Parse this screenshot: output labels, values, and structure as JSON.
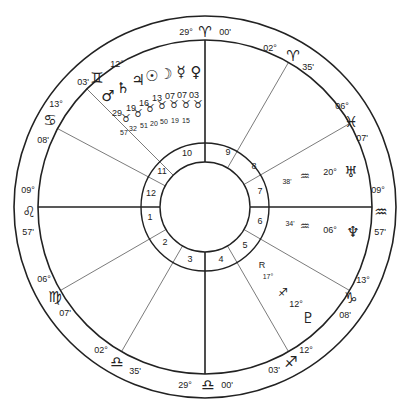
{
  "chart": {
    "center": [
      205,
      207
    ],
    "radii": {
      "outer": 191,
      "zodiac_inner": 167,
      "house_outer": 64,
      "house_inner": 45
    },
    "line_color": "#222222",
    "background": "#ffffff"
  },
  "cusps": [
    {
      "house": 1,
      "angle": 180,
      "heavy": true
    },
    {
      "house": 2,
      "angle": 210,
      "heavy": false
    },
    {
      "house": 3,
      "angle": 240,
      "heavy": false
    },
    {
      "house": 4,
      "angle": 270,
      "heavy": true
    },
    {
      "house": 5,
      "angle": 300,
      "heavy": false
    },
    {
      "house": 6,
      "angle": 330,
      "heavy": false
    },
    {
      "house": 7,
      "angle": 0,
      "heavy": true
    },
    {
      "house": 8,
      "angle": 30,
      "heavy": false
    },
    {
      "house": 9,
      "angle": 60,
      "heavy": false
    },
    {
      "house": 10,
      "angle": 90,
      "heavy": true
    },
    {
      "house": 11,
      "angle": 135,
      "heavy": false
    },
    {
      "house": 12,
      "angle": 152,
      "heavy": false
    }
  ],
  "house_numbers": [
    {
      "n": "1",
      "x": 150,
      "y": 220
    },
    {
      "n": "2",
      "x": 165,
      "y": 245
    },
    {
      "n": "3",
      "x": 190,
      "y": 262
    },
    {
      "n": "4",
      "x": 221,
      "y": 262
    },
    {
      "n": "5",
      "x": 245,
      "y": 248
    },
    {
      "n": "6",
      "x": 260,
      "y": 224
    },
    {
      "n": "7",
      "x": 260,
      "y": 194
    },
    {
      "n": "8",
      "x": 254,
      "y": 169
    },
    {
      "n": "9",
      "x": 228,
      "y": 155
    },
    {
      "n": "10",
      "x": 187,
      "y": 156
    },
    {
      "n": "11",
      "x": 162,
      "y": 174
    },
    {
      "n": "12",
      "x": 151,
      "y": 196
    }
  ],
  "cusp_signs": [
    {
      "cusp": "MC",
      "glyph": "♈",
      "deg": "29°",
      "min": "00'",
      "glyph_pos": [
        205,
        32
      ],
      "deg_pos": [
        186,
        32
      ],
      "min_pos": [
        225,
        32
      ]
    },
    {
      "cusp": "9",
      "glyph": "♈",
      "deg": "02°",
      "min": "35'",
      "glyph_pos": [
        293,
        56
      ],
      "deg_pos": [
        270,
        48
      ],
      "min_pos": [
        308,
        67
      ]
    },
    {
      "cusp": "8",
      "glyph": "♓",
      "deg": "06°",
      "min": "07'",
      "glyph_pos": [
        351,
        122
      ],
      "deg_pos": [
        342,
        106
      ],
      "min_pos": [
        362,
        138
      ]
    },
    {
      "cusp": "DSC",
      "glyph": "♒",
      "deg": "09°",
      "min": "57'",
      "glyph_pos": [
        381,
        212
      ],
      "deg_pos": [
        378,
        190
      ],
      "min_pos": [
        380,
        232
      ]
    },
    {
      "cusp": "6",
      "glyph": "♑",
      "deg": "13°",
      "min": "08'",
      "glyph_pos": [
        351,
        298
      ],
      "deg_pos": [
        363,
        280
      ],
      "min_pos": [
        345,
        315
      ]
    },
    {
      "cusp": "5",
      "glyph": "♐",
      "deg": "12°",
      "min": "03'",
      "glyph_pos": [
        291,
        362
      ],
      "deg_pos": [
        306,
        350
      ],
      "min_pos": [
        274,
        370
      ]
    },
    {
      "cusp": "IC",
      "glyph": "♎",
      "deg": "29°",
      "min": "00'",
      "glyph_pos": [
        208,
        385
      ],
      "deg_pos": [
        185,
        385
      ],
      "min_pos": [
        227,
        385
      ]
    },
    {
      "cusp": "3",
      "glyph": "♎",
      "deg": "02°",
      "min": "35'",
      "glyph_pos": [
        117,
        362
      ],
      "deg_pos": [
        101,
        350
      ],
      "min_pos": [
        135,
        371
      ]
    },
    {
      "cusp": "2",
      "glyph": "♍",
      "deg": "06°",
      "min": "07'",
      "glyph_pos": [
        55,
        297
      ],
      "deg_pos": [
        44,
        279
      ],
      "min_pos": [
        65,
        313
      ]
    },
    {
      "cusp": "ASC",
      "glyph": "♌",
      "deg": "09°",
      "min": "57'",
      "glyph_pos": [
        29,
        212
      ],
      "deg_pos": [
        28,
        190
      ],
      "min_pos": [
        28,
        232
      ]
    },
    {
      "cusp": "12",
      "glyph": "♋",
      "deg": "13°",
      "min": "08'",
      "glyph_pos": [
        50,
        120
      ],
      "deg_pos": [
        56,
        104
      ],
      "min_pos": [
        43,
        140
      ]
    },
    {
      "cusp": "11",
      "glyph": "♊",
      "deg": "12°",
      "min": "03'",
      "glyph_pos": [
        97,
        78
      ],
      "deg_pos": [
        117,
        64
      ],
      "min_pos": [
        83,
        82
      ]
    }
  ],
  "planets": [
    {
      "name": "Mars",
      "glyph": "♂",
      "deg": "29",
      "sign": "♉",
      "min": "57",
      "glyph_pos": [
        108,
        96
      ],
      "deg_pos": [
        117,
        113
      ],
      "sign_pos": [
        126,
        118
      ],
      "min_pos": [
        124,
        132
      ]
    },
    {
      "name": "Saturn",
      "glyph": "♄",
      "deg": "19",
      "sign": "♉",
      "min": "32",
      "glyph_pos": [
        123,
        88
      ],
      "deg_pos": [
        131,
        108
      ],
      "sign_pos": [
        138,
        113
      ],
      "min_pos": [
        133,
        128
      ]
    },
    {
      "name": "Jupiter",
      "glyph": "♃",
      "deg": "16",
      "sign": "♉",
      "min": "51",
      "glyph_pos": [
        138,
        80
      ],
      "deg_pos": [
        144,
        103
      ],
      "sign_pos": [
        150,
        108
      ],
      "min_pos": [
        144,
        125
      ]
    },
    {
      "name": "Sun",
      "glyph": "☉",
      "deg": "13",
      "sign": "♉",
      "min": "20",
      "glyph_pos": [
        152,
        76
      ],
      "deg_pos": [
        157,
        98
      ],
      "sign_pos": [
        162,
        105
      ],
      "min_pos": [
        154,
        123
      ]
    },
    {
      "name": "Moon",
      "glyph": "☽",
      "deg": "07",
      "sign": "♉",
      "min": "50",
      "glyph_pos": [
        166,
        74
      ],
      "deg_pos": [
        170,
        96
      ],
      "sign_pos": [
        174,
        104
      ],
      "min_pos": [
        164,
        121
      ]
    },
    {
      "name": "Mercury",
      "glyph": "☿",
      "deg": "07",
      "sign": "♉",
      "min": "19",
      "glyph_pos": [
        181,
        72
      ],
      "deg_pos": [
        182,
        95
      ],
      "sign_pos": [
        186,
        104
      ],
      "min_pos": [
        175,
        120
      ]
    },
    {
      "name": "Venus",
      "glyph": "♀",
      "deg": "03",
      "sign": "♉",
      "min": "15",
      "glyph_pos": [
        196,
        72
      ],
      "deg_pos": [
        194,
        95
      ],
      "sign_pos": [
        198,
        104
      ],
      "min_pos": [
        186,
        120
      ]
    },
    {
      "name": "Uranus",
      "glyph": "♅",
      "deg": "20°",
      "sign": "♒",
      "min": "38'",
      "glyph_pos": [
        351,
        172
      ],
      "deg_pos": [
        330,
        172
      ],
      "sign_pos": [
        305,
        176
      ],
      "min_pos": [
        287,
        181
      ]
    },
    {
      "name": "Neptune",
      "glyph": "♆",
      "deg": "06°",
      "sign": "♒",
      "min": "34'",
      "glyph_pos": [
        353,
        232
      ],
      "deg_pos": [
        330,
        230
      ],
      "sign_pos": [
        305,
        226
      ],
      "min_pos": [
        290,
        223
      ]
    },
    {
      "name": "Pluto",
      "glyph": "♇",
      "deg": "12°",
      "sign": "♐",
      "min": "17°",
      "retro": "R",
      "glyph_pos": [
        308,
        318
      ],
      "deg_pos": [
        296,
        304
      ],
      "sign_pos": [
        283,
        292
      ],
      "min_pos": [
        268,
        276
      ],
      "retro_pos": [
        262,
        265
      ]
    }
  ]
}
